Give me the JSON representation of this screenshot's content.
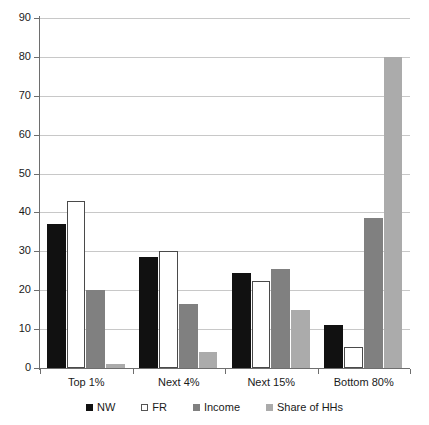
{
  "chart_data": {
    "type": "bar",
    "title": "",
    "subtitle": "",
    "xlabel": "",
    "ylabel": "",
    "ylim": [
      0,
      90
    ],
    "y_ticks": [
      0,
      10,
      20,
      30,
      40,
      50,
      60,
      70,
      80,
      90
    ],
    "grid": true,
    "legend_position": "bottom",
    "categories": [
      "Top 1%",
      "Next 4%",
      "Next 15%",
      "Bottom 80%"
    ],
    "series": [
      {
        "name": "NW",
        "color": "#111111",
        "values": [
          37,
          28.5,
          24.5,
          11
        ]
      },
      {
        "name": "FR",
        "color": "#ffffff",
        "values": [
          43,
          30,
          22.5,
          5.5
        ]
      },
      {
        "name": "Income",
        "color": "#808080",
        "values": [
          20,
          16.5,
          25.5,
          38.5
        ]
      },
      {
        "name": "Share of HHs",
        "color": "#ababab",
        "values": [
          1,
          4,
          15,
          80
        ]
      }
    ]
  },
  "axis": {
    "tick_labels": [
      "90",
      "80",
      "70",
      "60",
      "50",
      "40",
      "30",
      "20",
      "10",
      "0"
    ]
  },
  "legend": {
    "items": [
      {
        "label": "NW"
      },
      {
        "label": "FR"
      },
      {
        "label": "Income"
      },
      {
        "label": "Share of HHs"
      }
    ]
  }
}
